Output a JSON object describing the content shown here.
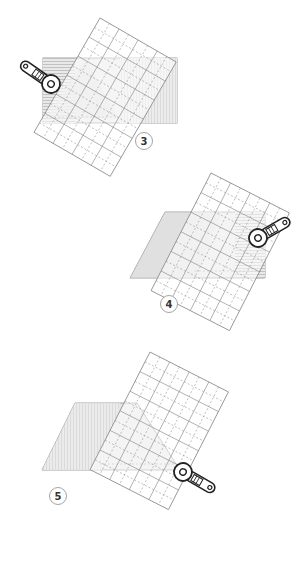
{
  "diagram": {
    "kind": "rotary-cutting-instruction-steps",
    "colors": {
      "background": "#ffffff",
      "fabric_fill": "#e6e6e6",
      "fabric_hatch": "#9a9a9a",
      "fabric_outline": "#8a8a8a",
      "ruler_line": "#8c8c8c",
      "ruler_dash": "#8c8c8c",
      "cutter_outline": "#222222",
      "label_circle": "#9a9a9a",
      "label_text": "#333333"
    },
    "steps": [
      {
        "number": "3",
        "label_pos": [
          144,
          141
        ],
        "cutter_side": "upper-left"
      },
      {
        "number": "4",
        "label_pos": [
          169,
          304
        ],
        "cutter_side": "right"
      },
      {
        "number": "5",
        "label_pos": [
          58,
          496
        ],
        "cutter_side": "lower-right"
      }
    ]
  }
}
